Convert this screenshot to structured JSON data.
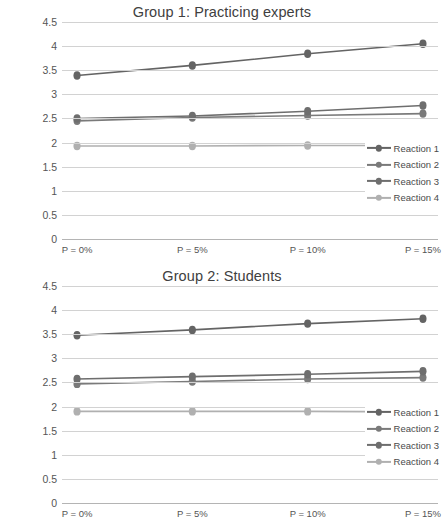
{
  "chart_data": [
    {
      "type": "line",
      "title": "Group 1: Practicing experts",
      "xlabel": "",
      "ylabel": "",
      "categories": [
        "P = 0%",
        "P = 5%",
        "P = 10%",
        "P = 15%"
      ],
      "yticks": [
        "0",
        "0.5",
        "1",
        "1.5",
        "2",
        "2.5",
        "3",
        "3.5",
        "4",
        "4.5"
      ],
      "ylim": [
        0,
        4.5
      ],
      "ytick_step": 0.5,
      "grid": "horizontal",
      "legend_position": "right-inside",
      "series": [
        {
          "name": "Reaction 1",
          "values": [
            3.39,
            3.6,
            3.84,
            4.05
          ],
          "color": "#646464"
        },
        {
          "name": "Reaction 2",
          "values": [
            2.45,
            2.52,
            2.56,
            2.6
          ],
          "color": "#7a7a7a"
        },
        {
          "name": "Reaction 3",
          "values": [
            2.5,
            2.55,
            2.65,
            2.77
          ],
          "color": "#6e6e6e"
        },
        {
          "name": "Reaction 4",
          "values": [
            1.93,
            1.93,
            1.94,
            1.94
          ],
          "color": "#b0b0b0"
        }
      ]
    },
    {
      "type": "line",
      "title": "Group 2: Students",
      "xlabel": "",
      "ylabel": "",
      "categories": [
        "P = 0%",
        "P = 5%",
        "P = 10%",
        "P = 15%"
      ],
      "yticks": [
        "0",
        "0.5",
        "1",
        "1.5",
        "2",
        "2.5",
        "3",
        "3.5",
        "4",
        "4.5"
      ],
      "ylim": [
        0,
        4.5
      ],
      "ytick_step": 0.5,
      "grid": "horizontal",
      "legend_position": "right-inside",
      "series": [
        {
          "name": "Reaction 1",
          "values": [
            3.48,
            3.59,
            3.72,
            3.82
          ],
          "color": "#646464"
        },
        {
          "name": "Reaction 2",
          "values": [
            2.47,
            2.52,
            2.57,
            2.6
          ],
          "color": "#7a7a7a"
        },
        {
          "name": "Reaction 3",
          "values": [
            2.57,
            2.62,
            2.67,
            2.73
          ],
          "color": "#6e6e6e"
        },
        {
          "name": "Reaction 4",
          "values": [
            1.9,
            1.9,
            1.9,
            1.89
          ],
          "color": "#b0b0b0"
        }
      ]
    }
  ]
}
